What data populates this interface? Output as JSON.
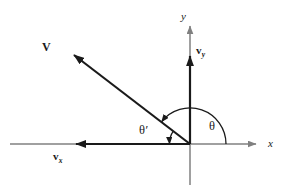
{
  "figure": {
    "type": "vector-decomposition-diagram",
    "background_color": "#ffffff",
    "axis_color": "#808080",
    "vector_color": "#1a1a1a",
    "origin": {
      "x": 190,
      "y": 144
    }
  },
  "axes": {
    "x": {
      "label": "x",
      "style": "italic",
      "line": {
        "x1": 10,
        "y1": 144,
        "x2": 262,
        "y2": 144
      },
      "arrow_at": "right"
    },
    "y": {
      "label": "y",
      "style": "italic",
      "line": {
        "x1": 190,
        "y1": 185,
        "x2": 190,
        "y2": 20
      },
      "arrow_at": "top"
    }
  },
  "vectors": [
    {
      "name": "V",
      "label": "V",
      "style": "bold",
      "from": {
        "x": 190,
        "y": 144
      },
      "to": {
        "x": 65,
        "y": 48
      },
      "quadrant": "second",
      "arrow_at": "tip"
    },
    {
      "name": "v_y",
      "label": "v",
      "subscript": "y",
      "style": "bold",
      "from": {
        "x": 190,
        "y": 144
      },
      "to": {
        "x": 190,
        "y": 48
      },
      "direction": "up",
      "arrow_at": "tip"
    },
    {
      "name": "v_x",
      "label": "v",
      "subscript": "x",
      "style": "bold",
      "from": {
        "x": 190,
        "y": 144
      },
      "to": {
        "x": 65,
        "y": 144
      },
      "direction": "left",
      "arrow_at": "tip"
    }
  ],
  "angles": [
    {
      "name": "theta",
      "label": "θ",
      "prime": "",
      "description": "angle measured counterclockwise from the positive x-axis to V",
      "arc": {
        "radius": 36,
        "start_deg": 0,
        "end_deg": 142
      },
      "arrow_at": "end"
    },
    {
      "name": "theta-prime",
      "label": "θ",
      "prime": "′",
      "description": "supplementary angle between the negative x-axis and V",
      "arc": {
        "radius": 21,
        "start_deg": 142,
        "end_deg": 180
      },
      "arrow_at": "end"
    }
  ]
}
